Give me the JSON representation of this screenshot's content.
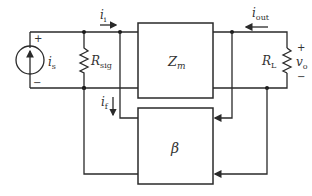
{
  "diagram": {
    "type": "feedback-amplifier-block-diagram",
    "source": {
      "symbol": "i",
      "subscript": "s",
      "plus": "+",
      "minus": "−"
    },
    "source_resistor": {
      "symbol": "R",
      "subscript": "sig"
    },
    "input_current": {
      "symbol": "i",
      "subscript": "i"
    },
    "feedback_current": {
      "symbol": "i",
      "subscript": "f"
    },
    "output_current": {
      "symbol": "i",
      "subscript": "out"
    },
    "amplifier_block": {
      "symbol": "Z",
      "subscript": "m"
    },
    "feedback_block": {
      "symbol": "β"
    },
    "load_resistor": {
      "symbol": "R",
      "subscript": "L"
    },
    "output_voltage": {
      "symbol": "v",
      "subscript": "o",
      "plus": "+",
      "minus": "−"
    }
  }
}
